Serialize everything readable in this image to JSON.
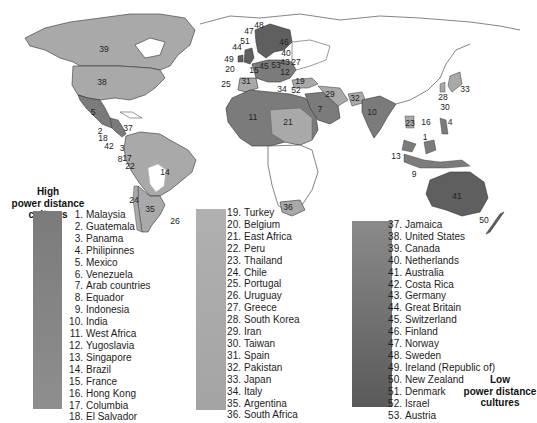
{
  "legend": {
    "high_title": [
      "High",
      "power distance",
      "cultures"
    ],
    "low_title": [
      "Low",
      "power distance",
      "cultures"
    ],
    "colors": {
      "high": "#7b7b7b",
      "medium": "#a9a9a9",
      "low": "#5f5f5f",
      "ocean": "#ffffff",
      "land_unrated": "#ffffff",
      "border": "#333333"
    },
    "groups": [
      {
        "name": "high",
        "items": [
          {
            "rank": "1.",
            "country": "Malaysia"
          },
          {
            "rank": "2.",
            "country": "Guatemala"
          },
          {
            "rank": "3.",
            "country": "Panama"
          },
          {
            "rank": "4.",
            "country": "Philipinnes"
          },
          {
            "rank": "5.",
            "country": "Mexico"
          },
          {
            "rank": "6.",
            "country": "Venezuela"
          },
          {
            "rank": "7.",
            "country": "Arab countries"
          },
          {
            "rank": "8.",
            "country": "Equador"
          },
          {
            "rank": "9.",
            "country": "Indonesia"
          },
          {
            "rank": "10.",
            "country": "India"
          },
          {
            "rank": "11.",
            "country": "West Africa"
          },
          {
            "rank": "12.",
            "country": "Yugoslavia"
          },
          {
            "rank": "13.",
            "country": "Singapore"
          },
          {
            "rank": "14.",
            "country": "Brazil"
          },
          {
            "rank": "15.",
            "country": "France"
          },
          {
            "rank": "16.",
            "country": "Hong Kong"
          },
          {
            "rank": "17.",
            "country": "Columbia"
          },
          {
            "rank": "18.",
            "country": "El Salvador"
          }
        ]
      },
      {
        "name": "medium",
        "items": [
          {
            "rank": "19.",
            "country": "Turkey"
          },
          {
            "rank": "20.",
            "country": "Belgium"
          },
          {
            "rank": "21.",
            "country": "East Africa"
          },
          {
            "rank": "22.",
            "country": "Peru"
          },
          {
            "rank": "23.",
            "country": "Thailand"
          },
          {
            "rank": "24.",
            "country": "Chile"
          },
          {
            "rank": "25.",
            "country": "Portugal"
          },
          {
            "rank": "26.",
            "country": "Uruguay"
          },
          {
            "rank": "27.",
            "country": "Greece"
          },
          {
            "rank": "28.",
            "country": "South Korea"
          },
          {
            "rank": "29.",
            "country": "Iran"
          },
          {
            "rank": "30.",
            "country": "Taiwan"
          },
          {
            "rank": "31.",
            "country": "Spain"
          },
          {
            "rank": "32.",
            "country": "Pakistan"
          },
          {
            "rank": "33.",
            "country": "Japan"
          },
          {
            "rank": "34.",
            "country": "Italy"
          },
          {
            "rank": "35.",
            "country": "Argentina"
          },
          {
            "rank": "36.",
            "country": "South Africa"
          }
        ]
      },
      {
        "name": "low",
        "items": [
          {
            "rank": "37.",
            "country": "Jamaica"
          },
          {
            "rank": "38.",
            "country": "United States"
          },
          {
            "rank": "39.",
            "country": "Canada"
          },
          {
            "rank": "40.",
            "country": "Netherlands"
          },
          {
            "rank": "41.",
            "country": "Australia"
          },
          {
            "rank": "42.",
            "country": "Costa Rica"
          },
          {
            "rank": "43.",
            "country": "Germany"
          },
          {
            "rank": "44.",
            "country": "Great Britain"
          },
          {
            "rank": "45.",
            "country": "Switzerland"
          },
          {
            "rank": "46.",
            "country": "Finland"
          },
          {
            "rank": "47.",
            "country": "Norway"
          },
          {
            "rank": "48.",
            "country": "Sweden"
          },
          {
            "rank": "49.",
            "country": "Ireland (Republic of)"
          },
          {
            "rank": "50.",
            "country": "New Zealand"
          },
          {
            "rank": "51.",
            "country": "Denmark"
          },
          {
            "rank": "52.",
            "country": "Israel"
          },
          {
            "rank": "53.",
            "country": "Austria"
          }
        ]
      }
    ]
  },
  "map_labels": [
    {
      "text": "39",
      "x": 104,
      "y": 52
    },
    {
      "text": "38",
      "x": 102,
      "y": 85
    },
    {
      "text": "5",
      "x": 93,
      "y": 115
    },
    {
      "text": "37",
      "x": 128,
      "y": 131
    },
    {
      "text": "2",
      "x": 100,
      "y": 134
    },
    {
      "text": "18",
      "x": 103,
      "y": 141
    },
    {
      "text": "42",
      "x": 109,
      "y": 149
    },
    {
      "text": "3",
      "x": 122,
      "y": 151
    },
    {
      "text": "8",
      "x": 120,
      "y": 162
    },
    {
      "text": "22",
      "x": 130,
      "y": 169
    },
    {
      "text": "14",
      "x": 165,
      "y": 175
    },
    {
      "text": "24",
      "x": 134,
      "y": 203
    },
    {
      "text": "35",
      "x": 150,
      "y": 212
    },
    {
      "text": "26",
      "x": 175,
      "y": 224
    },
    {
      "text": "48",
      "x": 259,
      "y": 28
    },
    {
      "text": "47",
      "x": 249,
      "y": 34
    },
    {
      "text": "51",
      "x": 245,
      "y": 44
    },
    {
      "text": "44",
      "x": 237,
      "y": 50
    },
    {
      "text": "46",
      "x": 284,
      "y": 45
    },
    {
      "text": "40",
      "x": 286,
      "y": 56
    },
    {
      "text": "49",
      "x": 229,
      "y": 62
    },
    {
      "text": "20",
      "x": 230,
      "y": 72
    },
    {
      "text": "43",
      "x": 285,
      "y": 65
    },
    {
      "text": "53",
      "x": 276,
      "y": 68
    },
    {
      "text": "15",
      "x": 254,
      "y": 73
    },
    {
      "text": "45",
      "x": 264,
      "y": 69
    },
    {
      "text": "27",
      "x": 296,
      "y": 65
    },
    {
      "text": "12",
      "x": 285,
      "y": 75
    },
    {
      "text": "31",
      "x": 246,
      "y": 84
    },
    {
      "text": "19",
      "x": 300,
      "y": 84
    },
    {
      "text": "25",
      "x": 226,
      "y": 87
    },
    {
      "text": "34",
      "x": 282,
      "y": 92
    },
    {
      "text": "52",
      "x": 296,
      "y": 93
    },
    {
      "text": "29",
      "x": 330,
      "y": 97
    },
    {
      "text": "32",
      "x": 355,
      "y": 101
    },
    {
      "text": "7",
      "x": 320,
      "y": 112
    },
    {
      "text": "11",
      "x": 253,
      "y": 120
    },
    {
      "text": "21",
      "x": 288,
      "y": 125
    },
    {
      "text": "10",
      "x": 372,
      "y": 115
    },
    {
      "text": "33",
      "x": 465,
      "y": 92
    },
    {
      "text": "28",
      "x": 443,
      "y": 100
    },
    {
      "text": "30",
      "x": 445,
      "y": 110
    },
    {
      "text": "16",
      "x": 426,
      "y": 125
    },
    {
      "text": "23",
      "x": 410,
      "y": 126
    },
    {
      "text": "4",
      "x": 450,
      "y": 125
    },
    {
      "text": "17",
      "x": 127,
      "y": 161
    },
    {
      "text": "1",
      "x": 425,
      "y": 140
    },
    {
      "text": "13",
      "x": 396,
      "y": 159
    },
    {
      "text": "9",
      "x": 414,
      "y": 177
    },
    {
      "text": "36",
      "x": 288,
      "y": 210
    },
    {
      "text": "41",
      "x": 457,
      "y": 199
    },
    {
      "text": "50",
      "x": 484,
      "y": 223
    }
  ]
}
